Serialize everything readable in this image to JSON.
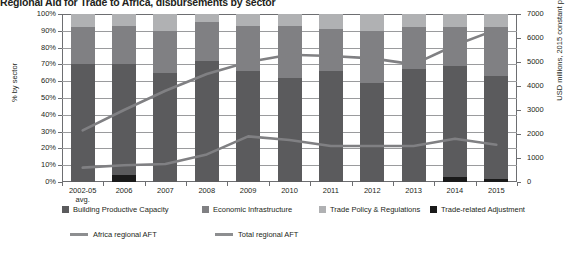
{
  "header": {
    "title": "Regional Aid for Trade to Africa, disbursements by sector"
  },
  "chart_data": {
    "type": "bar",
    "title": "Regional Aid for Trade to Africa, disbursements by sector",
    "subtitle": "",
    "xlabel": "",
    "ylabel": "% by sector",
    "y2label": "USD millions, 2015 constant prices",
    "categories": [
      "2002-05 avg.",
      "2006",
      "2007",
      "2008",
      "2009",
      "2010",
      "2011",
      "2012",
      "2013",
      "2014",
      "2015"
    ],
    "category_lines": [
      [
        "2002-05",
        "avg."
      ],
      [
        "2006",
        ""
      ],
      [
        "2007",
        ""
      ],
      [
        "2008",
        ""
      ],
      [
        "2009",
        ""
      ],
      [
        "2010",
        ""
      ],
      [
        "2011",
        ""
      ],
      [
        "2012",
        ""
      ],
      [
        "2013",
        ""
      ],
      [
        "2014",
        ""
      ],
      [
        "2015",
        ""
      ]
    ],
    "stacked": true,
    "grid": true,
    "legend_position": "bottom",
    "ylim": [
      0,
      100
    ],
    "yticks": [
      "0%",
      "10%",
      "20%",
      "30%",
      "40%",
      "50%",
      "60%",
      "70%",
      "80%",
      "90%",
      "100%"
    ],
    "y2lim": [
      0,
      7000
    ],
    "y2ticks": [
      "0",
      "1000",
      "2000",
      "3000",
      "4000",
      "5000",
      "6000",
      "7000"
    ],
    "series": [
      {
        "name": "Trade-related Adjustment",
        "color": "#1a1a1a",
        "values": [
          0,
          4,
          0,
          0,
          0,
          0,
          0,
          0,
          0,
          3,
          2
        ]
      },
      {
        "name": "Building Productive Capacity",
        "color": "#5b5b5d",
        "values": [
          70,
          66,
          65,
          72,
          66,
          62,
          66,
          59,
          67,
          66,
          61
        ]
      },
      {
        "name": "Economic Infrastructure",
        "color": "#808083",
        "values": [
          22,
          23,
          25,
          23,
          27,
          31,
          25,
          31,
          25,
          23,
          29
        ]
      },
      {
        "name": "Trade Policy & Regulations",
        "color": "#b0b1b3",
        "values": [
          8,
          7,
          10,
          5,
          7,
          7,
          9,
          10,
          8,
          8,
          8
        ]
      }
    ],
    "line_series": [
      {
        "name": "Africa regional AFT",
        "color": "#808083",
        "axis": "right",
        "values": [
          600,
          700,
          750,
          1150,
          1900,
          1750,
          1500,
          1500,
          1500,
          1800,
          1550
        ],
        "values_pct": [
          9,
          10,
          11,
          16,
          27,
          25,
          21,
          21,
          21,
          26,
          22
        ]
      },
      {
        "name": "Total regional AFT",
        "color": "#808083",
        "axis": "right",
        "values": [
          2150,
          3000,
          3800,
          4500,
          5000,
          5300,
          5250,
          5150,
          4900,
          5700,
          6350
        ],
        "values_pct": [
          31,
          43,
          54,
          64,
          71,
          76,
          75,
          74,
          70,
          81,
          91
        ]
      }
    ],
    "legend": {
      "bars": [
        {
          "label": "Building Productive Capacity",
          "color": "#5b5b5d"
        },
        {
          "label": "Economic Infrastructure",
          "color": "#808083"
        },
        {
          "label": "Trade Policy & Regulations",
          "color": "#b0b1b3"
        },
        {
          "label": "Trade-related Adjustment",
          "color": "#1a1a1a"
        }
      ],
      "lines": [
        {
          "label": "Africa regional AFT",
          "color": "#8d8e90"
        },
        {
          "label": "Total regional AFT",
          "color": "#8d8e90"
        }
      ]
    }
  }
}
